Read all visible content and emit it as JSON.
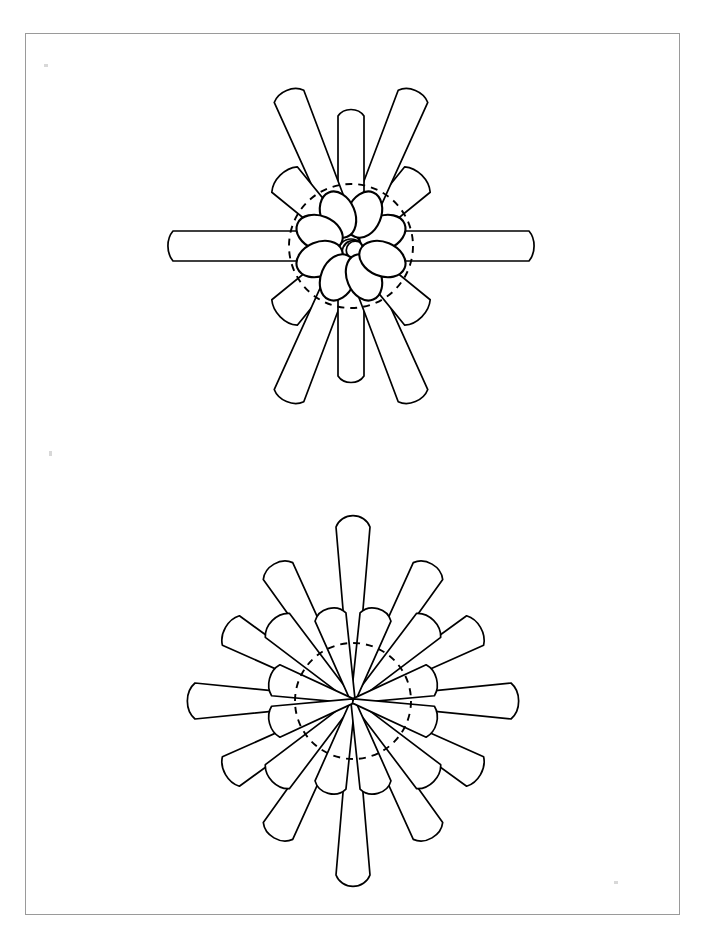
{
  "page": {
    "kind": "scientific-illustration-plate",
    "background_color": "#ffffff",
    "width": 705,
    "height": 942,
    "ink_color": "#000000",
    "frame": {
      "name": "plate-border",
      "stroke_color": "#9a9a9a",
      "left": 25,
      "top": 33,
      "width": 655,
      "height": 882,
      "label": ""
    },
    "caption": "",
    "labels": []
  },
  "figures": [
    {
      "id": "figure-top",
      "name": "upper-radial-spicule",
      "caption": "",
      "center_x": 350,
      "center_y": 245,
      "guide_circle_radius": 62,
      "guide_circle_style": "dashed",
      "inner_oval_count": 8,
      "inner_oval_rx": 17,
      "inner_oval_ry": 24,
      "inner_oval_center_radius": 34,
      "ray_count": 16,
      "ray_angle_step_deg": 22.5,
      "rays": [
        {
          "angle_deg": 0,
          "length": 198,
          "tip_rx": 20,
          "tip_ry": 18,
          "base_half_width": 15,
          "kind": "long-parallel"
        },
        {
          "angle_deg": 22.5,
          "length": 0,
          "tip_rx": 0,
          "tip_ry": 0,
          "base_half_width": 0,
          "kind": "none"
        },
        {
          "angle_deg": 45,
          "length": 118,
          "tip_rx": 24,
          "tip_ry": 18,
          "base_half_width": 9,
          "kind": "medium-wedge"
        },
        {
          "angle_deg": 67.5,
          "length": 182,
          "tip_rx": 20,
          "tip_ry": 16,
          "base_half_width": 11,
          "kind": "long-wedge"
        },
        {
          "angle_deg": 90,
          "length": 145,
          "tip_rx": 15,
          "tip_ry": 23,
          "base_half_width": 13,
          "kind": "medium-parallel"
        },
        {
          "angle_deg": 112.5,
          "length": 182,
          "tip_rx": 20,
          "tip_ry": 16,
          "base_half_width": 11,
          "kind": "long-wedge"
        },
        {
          "angle_deg": 135,
          "length": 118,
          "tip_rx": 24,
          "tip_ry": 18,
          "base_half_width": 9,
          "kind": "medium-wedge"
        },
        {
          "angle_deg": 157.5,
          "length": 0,
          "tip_rx": 0,
          "tip_ry": 0,
          "base_half_width": 0,
          "kind": "none"
        },
        {
          "angle_deg": 180,
          "length": 198,
          "tip_rx": 20,
          "tip_ry": 18,
          "base_half_width": 15,
          "kind": "long-parallel"
        },
        {
          "angle_deg": 202.5,
          "length": 0,
          "tip_rx": 0,
          "tip_ry": 0,
          "base_half_width": 0,
          "kind": "none"
        },
        {
          "angle_deg": 225,
          "length": 118,
          "tip_rx": 24,
          "tip_ry": 18,
          "base_half_width": 9,
          "kind": "medium-wedge"
        },
        {
          "angle_deg": 247.5,
          "length": 182,
          "tip_rx": 20,
          "tip_ry": 16,
          "base_half_width": 11,
          "kind": "long-wedge"
        },
        {
          "angle_deg": 270,
          "length": 145,
          "tip_rx": 15,
          "tip_ry": 23,
          "base_half_width": 13,
          "kind": "medium-parallel"
        },
        {
          "angle_deg": 292.5,
          "length": 182,
          "tip_rx": 20,
          "tip_ry": 16,
          "base_half_width": 11,
          "kind": "long-wedge"
        },
        {
          "angle_deg": 315,
          "length": 118,
          "tip_rx": 24,
          "tip_ry": 18,
          "base_half_width": 9,
          "kind": "medium-wedge"
        },
        {
          "angle_deg": 337.5,
          "length": 0,
          "tip_rx": 0,
          "tip_ry": 0,
          "base_half_width": 0,
          "kind": "none"
        }
      ]
    },
    {
      "id": "figure-bottom",
      "name": "lower-radial-spicule",
      "caption": "",
      "center_x": 352,
      "center_y": 700,
      "guide_circle_radius": 58,
      "guide_circle_style": "dashed",
      "inner_oval_count": 0,
      "ray_count": 24,
      "ray_angle_step_deg": 15,
      "rays": [
        {
          "angle_deg": 0,
          "length": 180,
          "tip_rx": 22,
          "tip_ry": 18,
          "base_half_width": 13,
          "kind": "long-wedge"
        },
        {
          "angle_deg": 15,
          "length": 100,
          "tip_rx": 20,
          "tip_ry": 16,
          "base_half_width": 10,
          "kind": "short-wedge"
        },
        {
          "angle_deg": 30,
          "length": 163,
          "tip_rx": 22,
          "tip_ry": 17,
          "base_half_width": 12,
          "kind": "long-wedge"
        },
        {
          "angle_deg": 45,
          "length": 128,
          "tip_rx": 21,
          "tip_ry": 17,
          "base_half_width": 10,
          "kind": "medium-wedge"
        },
        {
          "angle_deg": 60,
          "length": 170,
          "tip_rx": 20,
          "tip_ry": 17,
          "base_half_width": 11,
          "kind": "long-wedge"
        },
        {
          "angle_deg": 75,
          "length": 105,
          "tip_rx": 18,
          "tip_ry": 16,
          "base_half_width": 10,
          "kind": "short-wedge"
        },
        {
          "angle_deg": 90,
          "length": 192,
          "tip_rx": 18,
          "tip_ry": 25,
          "base_half_width": 13,
          "kind": "long-parallel"
        },
        {
          "angle_deg": 105,
          "length": 105,
          "tip_rx": 18,
          "tip_ry": 16,
          "base_half_width": 10,
          "kind": "short-wedge"
        },
        {
          "angle_deg": 120,
          "length": 170,
          "tip_rx": 20,
          "tip_ry": 17,
          "base_half_width": 11,
          "kind": "long-wedge"
        },
        {
          "angle_deg": 135,
          "length": 128,
          "tip_rx": 21,
          "tip_ry": 17,
          "base_half_width": 10,
          "kind": "medium-wedge"
        },
        {
          "angle_deg": 150,
          "length": 163,
          "tip_rx": 22,
          "tip_ry": 17,
          "base_half_width": 12,
          "kind": "long-wedge"
        },
        {
          "angle_deg": 165,
          "length": 100,
          "tip_rx": 20,
          "tip_ry": 16,
          "base_half_width": 10,
          "kind": "short-wedge"
        },
        {
          "angle_deg": 180,
          "length": 180,
          "tip_rx": 22,
          "tip_ry": 18,
          "base_half_width": 13,
          "kind": "long-wedge"
        },
        {
          "angle_deg": 195,
          "length": 100,
          "tip_rx": 20,
          "tip_ry": 16,
          "base_half_width": 10,
          "kind": "short-wedge"
        },
        {
          "angle_deg": 210,
          "length": 163,
          "tip_rx": 22,
          "tip_ry": 17,
          "base_half_width": 12,
          "kind": "long-wedge"
        },
        {
          "angle_deg": 225,
          "length": 128,
          "tip_rx": 21,
          "tip_ry": 17,
          "base_half_width": 10,
          "kind": "medium-wedge"
        },
        {
          "angle_deg": 240,
          "length": 170,
          "tip_rx": 20,
          "tip_ry": 17,
          "base_half_width": 11,
          "kind": "long-wedge"
        },
        {
          "angle_deg": 255,
          "length": 105,
          "tip_rx": 18,
          "tip_ry": 16,
          "base_half_width": 10,
          "kind": "short-wedge"
        },
        {
          "angle_deg": 270,
          "length": 192,
          "tip_rx": 18,
          "tip_ry": 25,
          "base_half_width": 13,
          "kind": "long-parallel"
        },
        {
          "angle_deg": 285,
          "length": 105,
          "tip_rx": 18,
          "tip_ry": 16,
          "base_half_width": 10,
          "kind": "short-wedge"
        },
        {
          "angle_deg": 300,
          "length": 170,
          "tip_rx": 20,
          "tip_ry": 17,
          "base_half_width": 11,
          "kind": "long-wedge"
        },
        {
          "angle_deg": 315,
          "length": 128,
          "tip_rx": 21,
          "tip_ry": 17,
          "base_half_width": 10,
          "kind": "medium-wedge"
        },
        {
          "angle_deg": 330,
          "length": 163,
          "tip_rx": 22,
          "tip_ry": 17,
          "base_half_width": 12,
          "kind": "long-wedge"
        },
        {
          "angle_deg": 345,
          "length": 100,
          "tip_rx": 20,
          "tip_ry": 16,
          "base_half_width": 10,
          "kind": "short-wedge"
        }
      ]
    }
  ],
  "specks": [
    {
      "name": "scan-speck-top-left",
      "x": 43,
      "y": 63,
      "width": 4,
      "height": 3
    },
    {
      "name": "scan-speck-mid-left",
      "x": 48,
      "y": 450,
      "width": 3,
      "height": 5
    },
    {
      "name": "scan-speck-bottom-right",
      "x": 613,
      "y": 880,
      "width": 4,
      "height": 3
    }
  ]
}
